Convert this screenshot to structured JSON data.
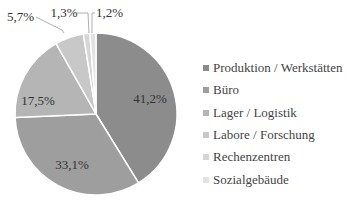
{
  "chart_data": {
    "type": "pie",
    "title": "",
    "categories": [
      "Produktion / Werkstätten",
      "Büro",
      "Lager / Logistik",
      "Labore / Forschung",
      "Rechenzentren",
      "Sozialgebäude"
    ],
    "values": [
      41.2,
      33.1,
      17.5,
      5.7,
      1.3,
      1.2
    ],
    "labels": [
      "41,2%",
      "33,1%",
      "17,5%",
      "5,7%",
      "1,3%",
      "1,2%"
    ],
    "colors": [
      "#8c8c8c",
      "#9e9e9e",
      "#b5b5b5",
      "#c8c8c8",
      "#d6d6d6",
      "#e2e2e2"
    ],
    "legend_position": "right",
    "start_angle_deg": 0,
    "direction": "clockwise"
  },
  "legend": {
    "items": [
      {
        "label": "Produktion / Werkstätten",
        "color": "#8c8c8c"
      },
      {
        "label": "Büro",
        "color": "#9e9e9e"
      },
      {
        "label": "Lager / Logistik",
        "color": "#b5b5b5"
      },
      {
        "label": "Labore / Forschung",
        "color": "#c8c8c8"
      },
      {
        "label": "Rechenzentren",
        "color": "#d6d6d6"
      },
      {
        "label": "Sozialgebäude",
        "color": "#e2e2e2"
      }
    ]
  }
}
